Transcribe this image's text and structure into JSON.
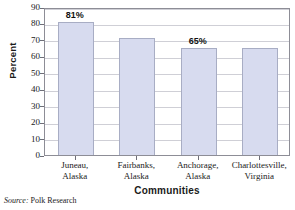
{
  "chart_data": {
    "type": "bar",
    "title": "",
    "xlabel": "Communities",
    "ylabel": "Percent",
    "categories": [
      "Juneau, Alaska",
      "Fairbanks, Alaska",
      "Anchorage, Alaska",
      "Charlottesville, Virginia"
    ],
    "category_lines": [
      [
        "Juneau,",
        "Alaska"
      ],
      [
        "Fairbanks,",
        "Alaska"
      ],
      [
        "Anchorage,",
        "Alaska"
      ],
      [
        "Charlottesville,",
        "Virginia"
      ]
    ],
    "values": [
      81,
      71,
      65,
      65
    ],
    "data_labels": [
      "81%",
      "",
      "65%",
      ""
    ],
    "ylim": [
      0,
      90
    ],
    "ytick_step": 10,
    "ytick_labels": [
      "90",
      "80",
      "70",
      "60",
      "50",
      "40",
      "30",
      "20",
      "10",
      "0"
    ],
    "grid": true,
    "legend": "none",
    "bar_color": "#d7dbef",
    "bar_border_color": "#a8adc4",
    "grid_color": "#cfcfd6",
    "frame_color": "#8d8d96"
  },
  "axes": {
    "y_title": "Percent",
    "x_title": "Communities"
  },
  "source": {
    "label": "Source:",
    "text": "Polk Research"
  }
}
